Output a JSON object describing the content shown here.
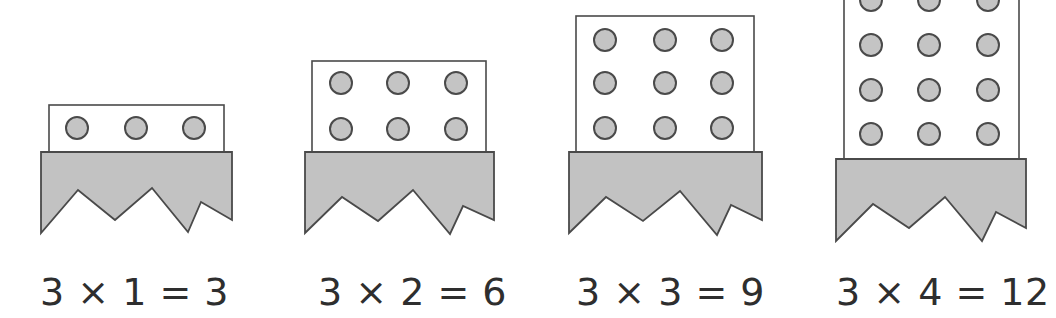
{
  "colors": {
    "background": "#ffffff",
    "box_fill": "#ffffff",
    "stroke": "#4a4a4a",
    "base_fill": "#c2c2c2",
    "dot_fill": "#c4c4c4",
    "text": "#2e2e2e"
  },
  "figures": [
    {
      "id": "fig-1",
      "rows": 1,
      "cols": 3,
      "equation": "3 × 1 = 3",
      "label_x": 40,
      "box": {
        "x": 49,
        "y": 105,
        "w": 175,
        "h": 47
      },
      "base": {
        "x": 41,
        "y": 152,
        "w": 191,
        "bottom": [
          [
            41,
            233
          ],
          [
            78,
            190
          ],
          [
            115,
            220
          ],
          [
            152,
            188
          ],
          [
            188,
            232
          ],
          [
            201,
            202
          ],
          [
            232,
            220
          ]
        ]
      },
      "dots_x": [
        77,
        136,
        194
      ],
      "dots_y": [
        128
      ]
    },
    {
      "id": "fig-2",
      "rows": 2,
      "cols": 3,
      "equation": "3 × 2 = 6",
      "label_x": 318,
      "box": {
        "x": 312,
        "y": 61,
        "w": 174,
        "h": 91
      },
      "base": {
        "x": 305,
        "y": 152,
        "w": 189,
        "bottom": [
          [
            305,
            233
          ],
          [
            342,
            197
          ],
          [
            378,
            221
          ],
          [
            413,
            190
          ],
          [
            450,
            234
          ],
          [
            463,
            206
          ],
          [
            494,
            220
          ]
        ]
      },
      "dots_x": [
        341,
        398,
        456
      ],
      "dots_y": [
        83,
        129
      ]
    },
    {
      "id": "fig-3",
      "rows": 3,
      "cols": 3,
      "equation": "3 × 3 = 9",
      "label_x": 576,
      "box": {
        "x": 576,
        "y": 16,
        "w": 178,
        "h": 136
      },
      "base": {
        "x": 569,
        "y": 152,
        "w": 193,
        "bottom": [
          [
            569,
            233
          ],
          [
            606,
            197
          ],
          [
            643,
            221
          ],
          [
            680,
            191
          ],
          [
            717,
            235
          ],
          [
            731,
            205
          ],
          [
            762,
            220
          ]
        ]
      },
      "dots_x": [
        605,
        665,
        722
      ],
      "dots_y": [
        40,
        83,
        128
      ]
    },
    {
      "id": "fig-4",
      "rows": 4,
      "cols": 3,
      "equation": "3 × 4 = 12",
      "label_x": 836,
      "box": {
        "x": 844,
        "y": -30,
        "w": 175,
        "h": 189
      },
      "base": {
        "x": 836,
        "y": 159,
        "w": 190,
        "bottom": [
          [
            836,
            241
          ],
          [
            873,
            204
          ],
          [
            909,
            228
          ],
          [
            945,
            197
          ],
          [
            982,
            241
          ],
          [
            996,
            212
          ],
          [
            1026,
            228
          ]
        ]
      },
      "dots_x": [
        871,
        929,
        988
      ],
      "dots_y": [
        0,
        45,
        90,
        134
      ]
    }
  ],
  "dot_radius": 11
}
